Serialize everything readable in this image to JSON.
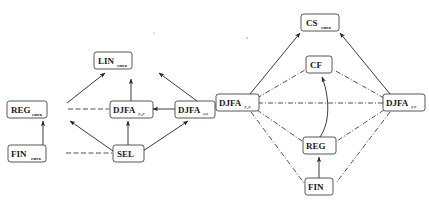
{
  "figure": {
    "panels": [
      {
        "id": "left-panel",
        "name": "left-inclusion-diagram",
        "nodes": [
          {
            "id": "lin",
            "base": "LIN",
            "sub": "cnvx",
            "x": 113,
            "y": 60,
            "w": 38,
            "h": 17
          },
          {
            "id": "reg",
            "base": "REG",
            "sub": "cnvx",
            "x": 27,
            "y": 101,
            "w": 40,
            "h": 17
          },
          {
            "id": "djfa_mid",
            "base": "DJFA",
            "sub": "≠,≠",
            "x": 110,
            "y": 101,
            "w": 41,
            "h": 17
          },
          {
            "id": "djfa_right",
            "base": "DJFA",
            "sub": "≠≠",
            "x": 192,
            "y": 101,
            "w": 39,
            "h": 17
          },
          {
            "id": "fin",
            "base": "FIN",
            "sub": "cnvx",
            "x": 27,
            "y": 145,
            "w": 38,
            "h": 17
          },
          {
            "id": "sel",
            "base": "SEL",
            "sub": "",
            "x": 113,
            "y": 145,
            "w": 30,
            "h": 17
          }
        ],
        "edges": [
          {
            "from": "reg",
            "to": "lin",
            "style": "solid",
            "arrow": true
          },
          {
            "from": "djfa_mid",
            "to": "lin",
            "style": "solid",
            "arrow": true
          },
          {
            "from": "djfa_right",
            "to": "lin",
            "style": "solid",
            "arrow": true
          },
          {
            "from": "reg",
            "to": "djfa_mid",
            "style": "dashed",
            "arrow": false
          },
          {
            "from": "djfa_right",
            "to": "djfa_mid",
            "style": "solid",
            "arrow": true
          },
          {
            "from": "fin",
            "to": "reg",
            "style": "solid",
            "arrow": true
          },
          {
            "from": "sel",
            "to": "reg",
            "style": "solid",
            "arrow": true
          },
          {
            "from": "sel",
            "to": "djfa_mid",
            "style": "solid",
            "arrow": true
          },
          {
            "from": "sel",
            "to": "djfa_right",
            "style": "solid",
            "arrow": true
          },
          {
            "from": "fin",
            "to": "sel",
            "style": "dashed",
            "arrow": false
          }
        ]
      },
      {
        "id": "right-panel",
        "name": "right-inclusion-diagram",
        "nodes": [
          {
            "id": "cs",
            "base": "CS",
            "sub": "cnvx",
            "x": 301,
            "y": 14,
            "w": 36,
            "h": 17
          },
          {
            "id": "cf",
            "base": "CF",
            "sub": "",
            "x": 308,
            "y": 56,
            "w": 24,
            "h": 17
          },
          {
            "id": "djfa_left",
            "base": "DJFA",
            "sub": "≠,≠",
            "x": 216,
            "y": 93,
            "w": 41,
            "h": 17
          },
          {
            "id": "djfa_right",
            "base": "DJFA",
            "sub": "≠≠",
            "x": 384,
            "y": 93,
            "w": 40,
            "h": 17
          },
          {
            "id": "reg",
            "base": "REG",
            "sub": "",
            "x": 304,
            "y": 137,
            "w": 31,
            "h": 17
          },
          {
            "id": "fin",
            "base": "FIN",
            "sub": "",
            "x": 306,
            "y": 178,
            "w": 27,
            "h": 17
          }
        ],
        "edges": [
          {
            "from": "djfa_left",
            "to": "cs",
            "style": "solid",
            "arrow": true
          },
          {
            "from": "djfa_right",
            "to": "cs",
            "style": "solid",
            "arrow": true
          },
          {
            "from": "djfa_left",
            "to": "cf",
            "style": "dashdot",
            "arrow": false
          },
          {
            "from": "djfa_right",
            "to": "cf",
            "style": "dashdot",
            "arrow": false
          },
          {
            "from": "djfa_left",
            "to": "djfa_right",
            "style": "dashdot",
            "arrow": false
          },
          {
            "from": "djfa_left",
            "to": "reg",
            "style": "dashdot",
            "arrow": false
          },
          {
            "from": "djfa_right",
            "to": "reg",
            "style": "dashdot",
            "arrow": false
          },
          {
            "from": "djfa_left",
            "to": "fin",
            "style": "dashdot",
            "arrow": false
          },
          {
            "from": "djfa_right",
            "to": "fin",
            "style": "dashdot",
            "arrow": false
          },
          {
            "from": "reg",
            "to": "cf",
            "style": "solid-curved",
            "arrow": true
          },
          {
            "from": "fin",
            "to": "reg",
            "style": "solid",
            "arrow": true
          }
        ]
      }
    ],
    "colors": {
      "stroke": "#242424",
      "node_fill": "#ffffff",
      "node_stroke": "#2b2b2b",
      "text": "#1a1a1a",
      "background": "#ffffff"
    }
  }
}
